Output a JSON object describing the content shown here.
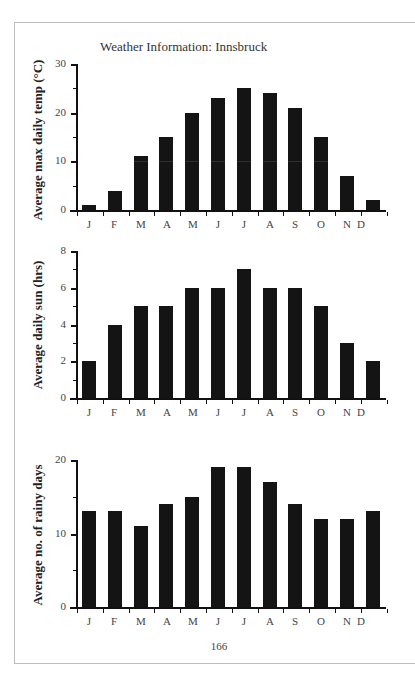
{
  "page": {
    "title": "Weather Information: Innsbruck",
    "page_number": "166"
  },
  "chart_data": [
    {
      "type": "bar",
      "title": "Weather Information: Innsbruck",
      "xlabel": "",
      "ylabel": "Average max daily temp (°C)",
      "categories": [
        "J",
        "F",
        "M",
        "A",
        "M",
        "J",
        "J",
        "A",
        "S",
        "O",
        "N",
        "D"
      ],
      "values": [
        1,
        4,
        11,
        15,
        20,
        23,
        25,
        24,
        21,
        15,
        7,
        2
      ],
      "ylim": [
        0,
        30
      ],
      "yticks": [
        "0",
        "10",
        "20",
        "30"
      ],
      "grid": false,
      "legend": null
    },
    {
      "type": "bar",
      "title": "",
      "xlabel": "",
      "ylabel": "Average daily sun (hrs)",
      "categories": [
        "J",
        "F",
        "M",
        "A",
        "M",
        "J",
        "J",
        "A",
        "S",
        "O",
        "N",
        "D"
      ],
      "values": [
        2,
        4,
        5,
        5,
        6,
        6,
        7,
        6,
        6,
        5,
        3,
        2
      ],
      "ylim": [
        0,
        8
      ],
      "yticks": [
        "0",
        "2",
        "4",
        "6",
        "8"
      ],
      "grid": false,
      "legend": null
    },
    {
      "type": "bar",
      "title": "",
      "xlabel": "",
      "ylabel": "Average no. of rainy days",
      "categories": [
        "J",
        "F",
        "M",
        "A",
        "M",
        "J",
        "J",
        "A",
        "S",
        "O",
        "N",
        "D"
      ],
      "values": [
        13,
        13,
        11,
        14,
        15,
        19,
        19,
        17,
        14,
        12,
        12,
        13
      ],
      "ylim": [
        0,
        20
      ],
      "yticks": [
        "0",
        "10",
        "20"
      ],
      "grid": false,
      "legend": null
    }
  ],
  "colors": {
    "bar": "#141414",
    "axis": "#111111",
    "frame": "#bdbdbd",
    "background": "#ffffff"
  }
}
